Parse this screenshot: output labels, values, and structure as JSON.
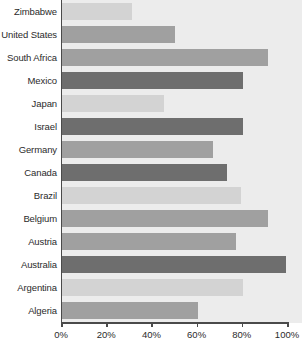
{
  "chart_data": {
    "type": "bar",
    "orientation": "horizontal",
    "title": "",
    "subtitle": "",
    "xlabel": "",
    "ylabel": "",
    "xlim": [
      0,
      100
    ],
    "ylim": null,
    "grid": false,
    "legend": null,
    "legend_position": "none",
    "value_suffix": "%",
    "categories": [
      "Zimbabwe",
      "United States",
      "South Africa",
      "Mexico",
      "Japan",
      "Israel",
      "Germany",
      "Canada",
      "Brazil",
      "Belgium",
      "Austria",
      "Australia",
      "Argentina",
      "Algeria"
    ],
    "values": [
      31,
      50,
      91,
      80,
      45,
      80,
      67,
      73,
      79,
      91,
      77,
      99,
      80,
      60
    ],
    "bar_shades": [
      "light",
      "medium",
      "medium",
      "dark",
      "light",
      "dark",
      "medium",
      "dark",
      "light",
      "medium",
      "medium",
      "dark",
      "light",
      "medium"
    ],
    "xticks": [
      0,
      20,
      40,
      60,
      80,
      100
    ],
    "xtick_labels": [
      "0%",
      "20%",
      "40%",
      "60%",
      "80%",
      "100%"
    ],
    "colors": {
      "light": "#d3d3d3",
      "medium": "#a0a0a0",
      "dark": "#6e6e6e",
      "plot_background": "#ececec",
      "axis": "#4a4a4a",
      "text": "#2b2b2b"
    }
  }
}
